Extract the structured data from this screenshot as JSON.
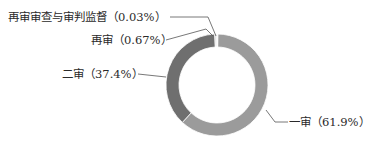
{
  "chart_data": {
    "type": "pie",
    "variant": "donut",
    "title": "",
    "categories": [
      "一审",
      "二审",
      "再审",
      "再审审查与审判监督"
    ],
    "values": [
      61.9,
      37.4,
      0.67,
      0.03
    ],
    "unit": "%",
    "colors": [
      "#9b9b9b",
      "#6f6f6f",
      "#d8d8d8",
      "#f2f2f2"
    ],
    "labels": [
      "一审（61.9%）",
      "二审（37.4%）",
      "再审（0.67%）",
      "再审审查与审判监督（0.03%）"
    ],
    "legend": "none",
    "label_style": "outside with leader lines"
  }
}
